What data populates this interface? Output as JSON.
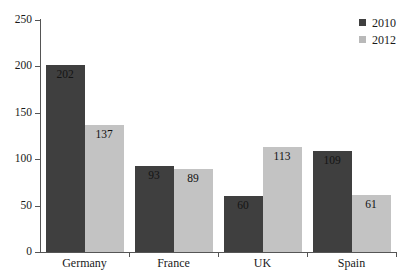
{
  "chart_data": {
    "type": "bar",
    "title": "",
    "subtitle": "",
    "xlabel": "",
    "ylabel": "",
    "categories": [
      "Germany",
      "France",
      "UK",
      "Spain"
    ],
    "series": [
      {
        "name": "2010",
        "color": "#3f3f3f",
        "values": [
          202,
          93,
          60,
          109
        ]
      },
      {
        "name": "2012",
        "color": "#c3c3c3",
        "values": [
          137,
          89,
          113,
          61
        ]
      }
    ],
    "ylim": [
      0,
      250
    ],
    "yticks": [
      0,
      50,
      100,
      150,
      200,
      250
    ],
    "ytick_labels": [
      "0",
      "50",
      "100",
      "150",
      "200",
      "250"
    ],
    "grid": false,
    "legend_position": "top-right",
    "value_labels": true,
    "value_label_position": "inside-top",
    "bar_group_layout": "adjacent"
  },
  "legend": {
    "entries": [
      {
        "label": "2010",
        "swatch": "#3f3f3f"
      },
      {
        "label": "2012",
        "swatch": "#b9b9b9"
      }
    ]
  },
  "axes": {
    "y_tick_labels": [
      "250",
      "200",
      "150",
      "100",
      "50",
      "0"
    ],
    "x_tick_labels": [
      "Germany",
      "France",
      "UK",
      "Spain"
    ]
  },
  "bars": [
    {
      "category": "Germany",
      "series": "2010",
      "value": 202,
      "label": "202"
    },
    {
      "category": "Germany",
      "series": "2012",
      "value": 137,
      "label": "137"
    },
    {
      "category": "France",
      "series": "2010",
      "value": 93,
      "label": "93"
    },
    {
      "category": "France",
      "series": "2012",
      "value": 89,
      "label": "89"
    },
    {
      "category": "UK",
      "series": "2010",
      "value": 60,
      "label": "60"
    },
    {
      "category": "UK",
      "series": "2012",
      "value": 113,
      "label": "113"
    },
    {
      "category": "Spain",
      "series": "2010",
      "value": 109,
      "label": "109"
    },
    {
      "category": "Spain",
      "series": "2012",
      "value": 61,
      "label": "61"
    }
  ]
}
